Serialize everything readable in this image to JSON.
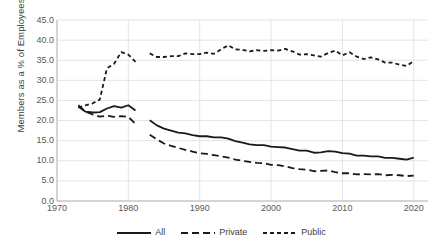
{
  "chart_data": {
    "type": "line",
    "title": "",
    "xlabel": "",
    "ylabel": "Members as a % of Employees",
    "xlim": [
      1970,
      2022
    ],
    "ylim": [
      0.0,
      45.0
    ],
    "grid": true,
    "legend_position": "bottom",
    "y_ticks": [
      "45.0",
      "40.0",
      "35.0",
      "30.0",
      "25.0",
      "20.0",
      "15.0",
      "10.0",
      "5.0",
      "0.0"
    ],
    "x_ticks": [
      "1970",
      "1980",
      "1990",
      "2000",
      "2010",
      "2020"
    ],
    "series": [
      {
        "name": "All",
        "style": "solid",
        "color": "#1a1a1a",
        "x": [
          1973,
          1974,
          1975,
          1976,
          1977,
          1978,
          1979,
          1980,
          1981,
          1983,
          1984,
          1985,
          1986,
          1987,
          1988,
          1989,
          1990,
          1991,
          1992,
          1993,
          1994,
          1995,
          1996,
          1997,
          1998,
          1999,
          2000,
          2001,
          2002,
          2003,
          2004,
          2005,
          2006,
          2007,
          2008,
          2009,
          2010,
          2011,
          2012,
          2013,
          2014,
          2015,
          2016,
          2017,
          2018,
          2019,
          2020
        ],
        "values": [
          23.5,
          22.2,
          22.0,
          22.1,
          23.0,
          23.6,
          23.2,
          23.8,
          22.5,
          20.1,
          18.8,
          18.0,
          17.5,
          17.0,
          16.8,
          16.4,
          16.1,
          16.1,
          15.8,
          15.8,
          15.5,
          14.9,
          14.5,
          14.1,
          13.9,
          13.9,
          13.5,
          13.4,
          13.3,
          12.9,
          12.5,
          12.5,
          12.0,
          12.1,
          12.4,
          12.3,
          11.9,
          11.8,
          11.3,
          11.3,
          11.1,
          11.1,
          10.7,
          10.7,
          10.5,
          10.3,
          10.8
        ]
      },
      {
        "name": "Private",
        "style": "dashed",
        "color": "#1a1a1a",
        "x": [
          1973,
          1974,
          1975,
          1976,
          1977,
          1978,
          1979,
          1980,
          1981,
          1983,
          1984,
          1985,
          1986,
          1987,
          1988,
          1989,
          1990,
          1991,
          1992,
          1993,
          1994,
          1995,
          1996,
          1997,
          1998,
          1999,
          2000,
          2001,
          2002,
          2003,
          2004,
          2005,
          2006,
          2007,
          2008,
          2009,
          2010,
          2011,
          2012,
          2013,
          2014,
          2015,
          2016,
          2017,
          2018,
          2019,
          2020
        ],
        "values": [
          23.8,
          22.2,
          21.5,
          21.0,
          21.2,
          20.9,
          21.1,
          20.9,
          19.2,
          16.5,
          15.3,
          14.3,
          13.7,
          13.2,
          12.7,
          12.3,
          11.9,
          11.7,
          11.4,
          11.1,
          10.8,
          10.3,
          10.0,
          9.7,
          9.5,
          9.4,
          9.0,
          8.9,
          8.6,
          8.2,
          7.9,
          7.8,
          7.4,
          7.5,
          7.6,
          7.2,
          6.9,
          6.9,
          6.6,
          6.7,
          6.6,
          6.7,
          6.4,
          6.5,
          6.4,
          6.2,
          6.3
        ]
      },
      {
        "name": "Public",
        "style": "dotted",
        "color": "#1a1a1a",
        "x": [
          1973,
          1974,
          1975,
          1976,
          1977,
          1978,
          1979,
          1980,
          1981,
          1983,
          1984,
          1985,
          1986,
          1987,
          1988,
          1989,
          1990,
          1991,
          1992,
          1993,
          1994,
          1995,
          1996,
          1997,
          1998,
          1999,
          2000,
          2001,
          2002,
          2003,
          2004,
          2005,
          2006,
          2007,
          2008,
          2009,
          2010,
          2011,
          2012,
          2013,
          2014,
          2015,
          2016,
          2017,
          2018,
          2019,
          2020
        ],
        "values": [
          23.2,
          23.8,
          24.3,
          25.2,
          33.0,
          34.1,
          37.0,
          36.4,
          34.6,
          36.7,
          35.8,
          35.8,
          36.0,
          36.0,
          36.7,
          36.5,
          36.5,
          36.9,
          36.6,
          37.7,
          38.7,
          37.7,
          37.6,
          37.2,
          37.5,
          37.3,
          37.5,
          37.4,
          37.8,
          37.2,
          36.4,
          36.5,
          36.2,
          35.9,
          36.8,
          37.4,
          36.2,
          37.0,
          35.9,
          35.3,
          35.7,
          35.2,
          34.4,
          34.4,
          33.9,
          33.6,
          34.8
        ]
      }
    ]
  },
  "legend": {
    "items": [
      {
        "label": "All",
        "style": "solid"
      },
      {
        "label": "Private",
        "style": "dashed"
      },
      {
        "label": "Public",
        "style": "dotted"
      }
    ]
  }
}
